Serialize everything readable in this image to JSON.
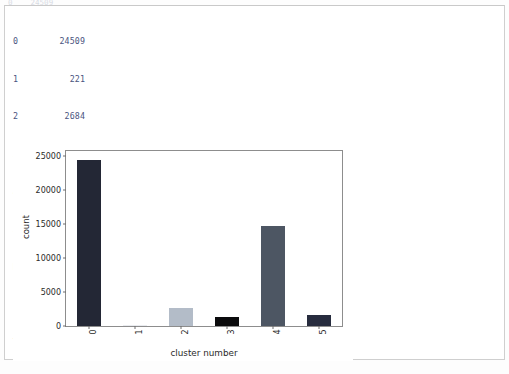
{
  "clipped_top_text": "0    24509",
  "output": {
    "series_rows": [
      {
        "index": "0",
        "value": "24509"
      },
      {
        "index": "1",
        "value": "221"
      },
      {
        "index": "2",
        "value": "2684"
      },
      {
        "index": "3",
        "value": "1380"
      },
      {
        "index": "4",
        "value": "14734"
      },
      {
        "index": "5",
        "value": "1683"
      }
    ],
    "series_meta": "Name: cluster_number, dtype: int64\\n",
    "text_repr": "Text(0,0.5,'count')"
  },
  "chart_data": {
    "type": "bar",
    "title": "",
    "xlabel": "cluster number",
    "ylabel": "count",
    "categories": [
      "0",
      "1",
      "2",
      "3",
      "4",
      "5"
    ],
    "values": [
      24509,
      221,
      2684,
      1380,
      14734,
      1683
    ],
    "colors": [
      "#232735",
      "#e9ebef",
      "#b3bcc8",
      "#0b0b0d",
      "#4d5663",
      "#272c3e"
    ],
    "ylim": [
      0,
      25800
    ],
    "yticks": [
      0,
      5000,
      10000,
      15000,
      20000,
      25000
    ],
    "ytick_labels": [
      "0",
      "5000",
      "10000",
      "15000",
      "20000",
      "25000"
    ],
    "xtick_labels": [
      "0",
      "1",
      "2",
      "3",
      "4",
      "5"
    ],
    "xtick_rotation": 90,
    "grid": false,
    "legend": false
  }
}
